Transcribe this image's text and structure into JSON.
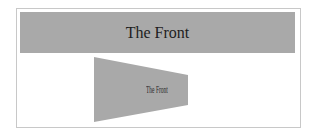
{
  "front_bar": {
    "title": "The Front",
    "color": "#a9a9a9"
  },
  "rotated_card": {
    "label": "The Front",
    "color": "#a9a9a9"
  },
  "frame": {
    "border_color": "#c8c8c8"
  }
}
